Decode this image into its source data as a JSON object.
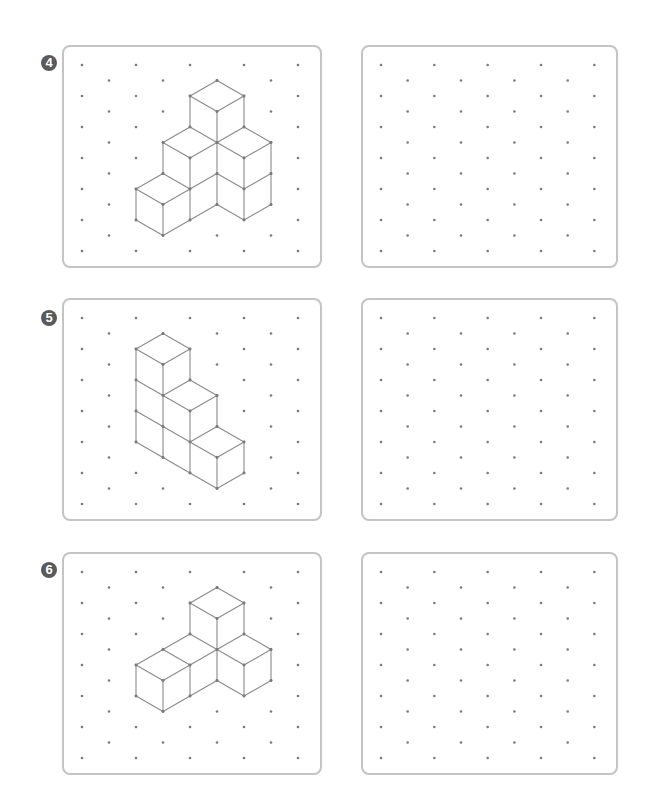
{
  "page": {
    "background": "#ffffff"
  },
  "style": {
    "badge_color": "#5a5a5a",
    "panel_border_color": "#c4c4c4",
    "dot_color": "#7a7a7a",
    "line_color": "#8a8a8a"
  },
  "grid": {
    "rows": 13,
    "row_step": 15.5,
    "first_row_offset": 20,
    "columns": 9,
    "dot_rule": "dots where (column + row) is even"
  },
  "exercises": [
    {
      "number": "4",
      "badge_symbol": "④",
      "top": 45,
      "figure": {
        "description": "isometric cube structure: 7 visible cubes",
        "edges": [
          [
            [
              5,
              1
            ],
            [
              4,
              2
            ]
          ],
          [
            [
              5,
              1
            ],
            [
              6,
              2
            ]
          ],
          [
            [
              4,
              2
            ],
            [
              5,
              3
            ]
          ],
          [
            [
              6,
              2
            ],
            [
              5,
              3
            ]
          ],
          [
            [
              4,
              2
            ],
            [
              4,
              4
            ]
          ],
          [
            [
              5,
              3
            ],
            [
              5,
              5
            ]
          ],
          [
            [
              6,
              2
            ],
            [
              6,
              4
            ]
          ],
          [
            [
              4,
              4
            ],
            [
              5,
              5
            ]
          ],
          [
            [
              6,
              4
            ],
            [
              5,
              5
            ]
          ],
          [
            [
              4,
              4
            ],
            [
              3,
              5
            ]
          ],
          [
            [
              3,
              5
            ],
            [
              4,
              6
            ]
          ],
          [
            [
              4,
              6
            ],
            [
              5,
              5
            ]
          ],
          [
            [
              6,
              4
            ],
            [
              7,
              5
            ]
          ],
          [
            [
              7,
              5
            ],
            [
              6,
              6
            ]
          ],
          [
            [
              6,
              6
            ],
            [
              5,
              5
            ]
          ],
          [
            [
              3,
              5
            ],
            [
              3,
              7
            ]
          ],
          [
            [
              4,
              6
            ],
            [
              4,
              10
            ]
          ],
          [
            [
              5,
              5
            ],
            [
              5,
              9
            ]
          ],
          [
            [
              6,
              6
            ],
            [
              6,
              10
            ]
          ],
          [
            [
              7,
              5
            ],
            [
              7,
              9
            ]
          ],
          [
            [
              3,
              7
            ],
            [
              2,
              8
            ]
          ],
          [
            [
              2,
              8
            ],
            [
              3,
              9
            ]
          ],
          [
            [
              3,
              9
            ],
            [
              4,
              8
            ]
          ],
          [
            [
              3,
              7
            ],
            [
              4,
              8
            ]
          ],
          [
            [
              4,
              8
            ],
            [
              5,
              7
            ]
          ],
          [
            [
              5,
              7
            ],
            [
              6,
              8
            ]
          ],
          [
            [
              6,
              8
            ],
            [
              7,
              7
            ]
          ],
          [
            [
              2,
              8
            ],
            [
              2,
              10
            ]
          ],
          [
            [
              3,
              9
            ],
            [
              3,
              11
            ]
          ],
          [
            [
              2,
              10
            ],
            [
              3,
              11
            ]
          ],
          [
            [
              3,
              11
            ],
            [
              4,
              10
            ]
          ],
          [
            [
              4,
              10
            ],
            [
              5,
              9
            ]
          ],
          [
            [
              5,
              9
            ],
            [
              6,
              10
            ]
          ],
          [
            [
              6,
              10
            ],
            [
              7,
              9
            ]
          ]
        ]
      }
    },
    {
      "number": "5",
      "badge_symbol": "⑤",
      "top": 298,
      "figure": {
        "description": "isometric staircase of cubes (3-2-1)",
        "edges": [
          [
            [
              3,
              1
            ],
            [
              2,
              2
            ]
          ],
          [
            [
              3,
              1
            ],
            [
              4,
              2
            ]
          ],
          [
            [
              2,
              2
            ],
            [
              3,
              3
            ]
          ],
          [
            [
              4,
              2
            ],
            [
              3,
              3
            ]
          ],
          [
            [
              2,
              2
            ],
            [
              2,
              8
            ]
          ],
          [
            [
              3,
              3
            ],
            [
              3,
              9
            ]
          ],
          [
            [
              4,
              2
            ],
            [
              4,
              4
            ]
          ],
          [
            [
              2,
              4
            ],
            [
              3,
              5
            ]
          ],
          [
            [
              4,
              4
            ],
            [
              3,
              5
            ]
          ],
          [
            [
              4,
              4
            ],
            [
              5,
              5
            ]
          ],
          [
            [
              3,
              5
            ],
            [
              4,
              6
            ]
          ],
          [
            [
              5,
              5
            ],
            [
              4,
              6
            ]
          ],
          [
            [
              2,
              6
            ],
            [
              3,
              7
            ]
          ],
          [
            [
              3,
              7
            ],
            [
              4,
              8
            ]
          ],
          [
            [
              4,
              6
            ],
            [
              4,
              10
            ]
          ],
          [
            [
              5,
              5
            ],
            [
              5,
              7
            ]
          ],
          [
            [
              5,
              7
            ],
            [
              4,
              8
            ]
          ],
          [
            [
              5,
              7
            ],
            [
              6,
              8
            ]
          ],
          [
            [
              4,
              8
            ],
            [
              5,
              9
            ]
          ],
          [
            [
              6,
              8
            ],
            [
              5,
              9
            ]
          ],
          [
            [
              2,
              8
            ],
            [
              3,
              9
            ]
          ],
          [
            [
              3,
              9
            ],
            [
              4,
              10
            ]
          ],
          [
            [
              4,
              10
            ],
            [
              5,
              11
            ]
          ],
          [
            [
              5,
              11
            ],
            [
              6,
              10
            ]
          ],
          [
            [
              5,
              9
            ],
            [
              5,
              11
            ]
          ],
          [
            [
              6,
              8
            ],
            [
              6,
              10
            ]
          ]
        ]
      }
    },
    {
      "number": "6",
      "badge_symbol": "⑥",
      "top": 552,
      "figure": {
        "description": "isometric cube structure: 4 visible cubes",
        "edges": [
          [
            [
              5,
              1
            ],
            [
              4,
              2
            ]
          ],
          [
            [
              5,
              1
            ],
            [
              6,
              2
            ]
          ],
          [
            [
              4,
              2
            ],
            [
              5,
              3
            ]
          ],
          [
            [
              6,
              2
            ],
            [
              5,
              3
            ]
          ],
          [
            [
              4,
              2
            ],
            [
              4,
              4
            ]
          ],
          [
            [
              5,
              3
            ],
            [
              5,
              7
            ]
          ],
          [
            [
              6,
              2
            ],
            [
              6,
              4
            ]
          ],
          [
            [
              4,
              4
            ],
            [
              5,
              5
            ]
          ],
          [
            [
              6,
              4
            ],
            [
              5,
              5
            ]
          ],
          [
            [
              4,
              4
            ],
            [
              3,
              5
            ]
          ],
          [
            [
              3,
              5
            ],
            [
              2,
              6
            ]
          ],
          [
            [
              2,
              6
            ],
            [
              3,
              7
            ]
          ],
          [
            [
              3,
              7
            ],
            [
              4,
              6
            ]
          ],
          [
            [
              3,
              5
            ],
            [
              4,
              6
            ]
          ],
          [
            [
              4,
              6
            ],
            [
              5,
              5
            ]
          ],
          [
            [
              6,
              4
            ],
            [
              7,
              5
            ]
          ],
          [
            [
              7,
              5
            ],
            [
              6,
              6
            ]
          ],
          [
            [
              6,
              6
            ],
            [
              5,
              5
            ]
          ],
          [
            [
              2,
              6
            ],
            [
              2,
              8
            ]
          ],
          [
            [
              3,
              7
            ],
            [
              3,
              9
            ]
          ],
          [
            [
              4,
              6
            ],
            [
              4,
              8
            ]
          ],
          [
            [
              6,
              6
            ],
            [
              6,
              8
            ]
          ],
          [
            [
              7,
              5
            ],
            [
              7,
              7
            ]
          ],
          [
            [
              2,
              8
            ],
            [
              3,
              9
            ]
          ],
          [
            [
              3,
              9
            ],
            [
              4,
              8
            ]
          ],
          [
            [
              4,
              8
            ],
            [
              5,
              7
            ]
          ],
          [
            [
              5,
              7
            ],
            [
              6,
              8
            ]
          ],
          [
            [
              6,
              8
            ],
            [
              7,
              7
            ]
          ]
        ]
      }
    }
  ],
  "panels": {
    "left": {
      "x": 62,
      "width": 260,
      "height": 223,
      "dot_x0": 20,
      "dot_dx": 27
    },
    "right": {
      "x": 361,
      "width": 257,
      "height": 223,
      "dot_x0": 20,
      "dot_dx": 26.67
    }
  }
}
